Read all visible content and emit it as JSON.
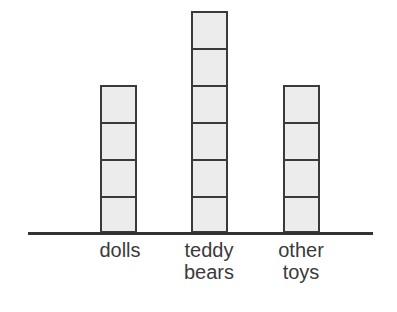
{
  "chart_data": {
    "type": "bar",
    "title": "",
    "xlabel": "",
    "ylabel": "",
    "categories": [
      "dolls",
      "teddy bears",
      "other toys"
    ],
    "values": [
      4,
      6,
      4
    ],
    "unit": "stacked blocks",
    "ylim": [
      0,
      6
    ],
    "grid": false,
    "legend": null
  },
  "labels": {
    "dolls": "dolls",
    "teddy": "teddy\nbears",
    "other": "other\ntoys"
  },
  "colors": {
    "block_fill": "#ececec",
    "block_border": "#3a3a3a",
    "baseline": "#333333",
    "text": "#3a3a3a"
  }
}
